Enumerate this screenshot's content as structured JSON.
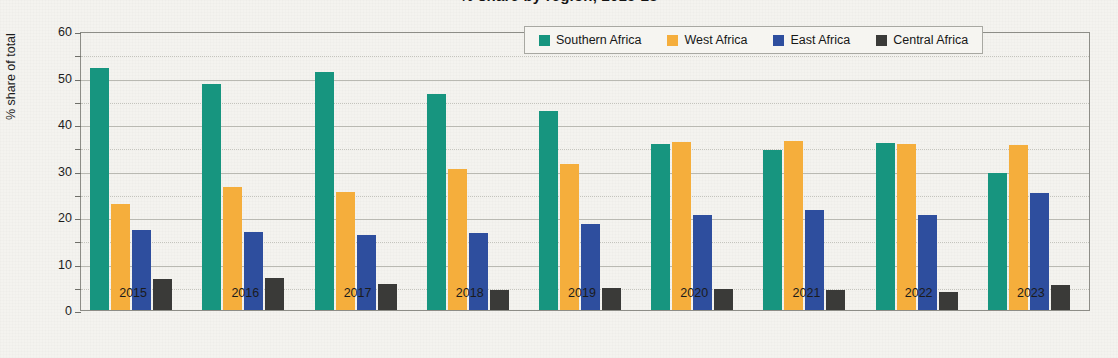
{
  "chart_data": {
    "type": "bar",
    "title": "% share by region, 2015-23",
    "xlabel": "",
    "ylabel": "% share of total",
    "ylim": [
      0,
      60
    ],
    "ytick_step": 10,
    "minor_gridline_step": 5,
    "grid": true,
    "legend_position": "top-right",
    "categories": [
      "2015",
      "2016",
      "2017",
      "2018",
      "2019",
      "2020",
      "2021",
      "2022",
      "2023"
    ],
    "series": [
      {
        "name": "Southern Africa",
        "color": "#17957f",
        "values": [
          52.0,
          48.6,
          51.2,
          46.5,
          42.7,
          35.8,
          34.5,
          35.9,
          29.4
        ]
      },
      {
        "name": "West Africa",
        "color": "#f5ae3c",
        "values": [
          22.9,
          26.4,
          25.3,
          30.4,
          31.5,
          36.1,
          36.3,
          35.8,
          35.5
        ]
      },
      {
        "name": "East Africa",
        "color": "#2e4e9e",
        "values": [
          17.3,
          16.7,
          16.2,
          16.5,
          18.6,
          20.5,
          21.6,
          20.5,
          25.2
        ]
      },
      {
        "name": "Central Africa",
        "color": "#3a3a38",
        "values": [
          6.6,
          6.9,
          5.7,
          4.3,
          4.8,
          4.6,
          4.2,
          3.8,
          5.4
        ]
      }
    ],
    "ytick_labels": [
      "60",
      "50",
      "40",
      "30",
      "20",
      "10",
      "0"
    ]
  },
  "legend": {
    "items": [
      {
        "label": "Southern Africa",
        "color": "#17957f"
      },
      {
        "label": "West Africa",
        "color": "#f5ae3c"
      },
      {
        "label": "East Africa",
        "color": "#2e4e9e"
      },
      {
        "label": "Central Africa",
        "color": "#3a3a38"
      }
    ]
  }
}
